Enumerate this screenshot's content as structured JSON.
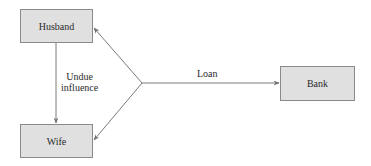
{
  "diagram": {
    "type": "relationship-flow",
    "colors": {
      "node_fill": "#e0e0e0",
      "node_border": "#8a8a8a",
      "edge": "#7a7a7a",
      "text": "#2a2a2a"
    },
    "nodes": [
      {
        "id": "husband",
        "label": "Husband"
      },
      {
        "id": "wife",
        "label": "Wife"
      },
      {
        "id": "bank",
        "label": "Bank"
      }
    ],
    "edges": [
      {
        "from": "husband",
        "to": "wife",
        "label_line1": "Undue",
        "label_line2": "influence"
      },
      {
        "from": "branch",
        "to": "bank",
        "label": "Loan"
      },
      {
        "from": "branch",
        "to": "husband",
        "label": ""
      },
      {
        "from": "branch",
        "to": "wife",
        "label": ""
      }
    ]
  }
}
